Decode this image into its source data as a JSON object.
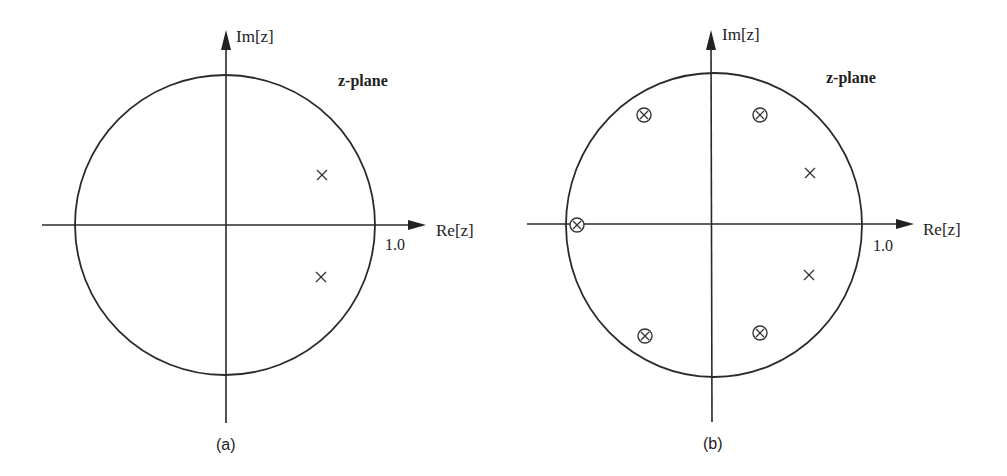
{
  "figure": {
    "panels": [
      {
        "id": "a",
        "caption": "(a)",
        "plane_label": "z-plane",
        "im_axis_label": "Im[z]",
        "re_axis_label": "Re[z]",
        "unit_tick_label": "1.0",
        "center": [
          225,
          225
        ],
        "radius": 150,
        "poles": [
          {
            "re": 0.65,
            "im": 0.33
          },
          {
            "re": 0.65,
            "im": -0.35
          }
        ],
        "zeros": []
      },
      {
        "id": "b",
        "caption": "(b)",
        "plane_label": "z-plane",
        "im_axis_label": "Im[z]",
        "re_axis_label": "Re[z]",
        "unit_tick_label": "1.0",
        "center": [
          713,
          225
        ],
        "radius": 148,
        "poles": [
          {
            "re": 0.65,
            "im": 0.35
          },
          {
            "re": 0.65,
            "im": -0.34
          }
        ],
        "zeros": [
          {
            "re": -0.47,
            "im": 0.75
          },
          {
            "re": 0.32,
            "im": 0.75
          },
          {
            "re": -0.92,
            "im": 0.0
          },
          {
            "re": -0.46,
            "im": -0.75
          },
          {
            "re": 0.32,
            "im": -0.73
          }
        ]
      }
    ],
    "legend": {
      "pole_symbol": "×",
      "zero_symbol": "⊗"
    }
  }
}
